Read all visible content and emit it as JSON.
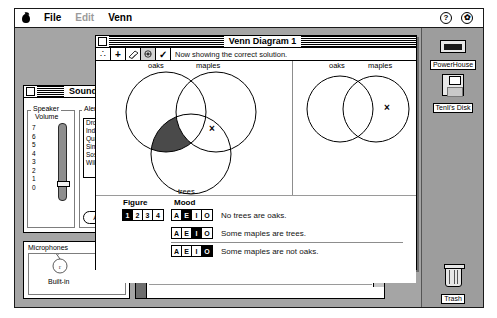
{
  "menubar": {
    "apple_icon": "apple-logo",
    "items": [
      {
        "label": "File",
        "enabled": true
      },
      {
        "label": "Edit",
        "enabled": false
      },
      {
        "label": "Venn",
        "enabled": true
      }
    ],
    "right_icons": [
      {
        "name": "help-icon",
        "glyph": "?"
      },
      {
        "name": "application-menu-icon",
        "glyph": "✿"
      }
    ]
  },
  "desktop": {
    "icons": [
      {
        "name": "hard-disk-icon",
        "label": "PowerHouse"
      },
      {
        "name": "floppy-disk-icon",
        "label": "Tenli's Disk"
      }
    ],
    "trash": {
      "label": "Trash"
    }
  },
  "sound_panel": {
    "title": "Sound",
    "speaker_group": {
      "label_line1": "Speaker",
      "label_line2": "Volume",
      "ticks": [
        "7",
        "6",
        "5",
        "4",
        "3",
        "2",
        "1",
        "0"
      ],
      "value": "2"
    },
    "alert_group": {
      "label": "Alert Sounds",
      "sounds": [
        "Droplet",
        "Indigo",
        "Quack",
        "Simple Beep",
        "Sosumi",
        "Wild Eep"
      ],
      "add_button": "Add"
    }
  },
  "mic_panel": {
    "title": "Microphones",
    "device_label": "Built-in"
  },
  "text_window": {
    "lines": [
      "Did gyre and gimble in the wabe.",
      "All mimsy were the borogoves,",
      "And the mome raths outgrabe."
    ]
  },
  "venn_window": {
    "title": "Venn Diagram 1",
    "toolbar": {
      "buttons": [
        {
          "name": "therefore-icon",
          "glyph": "∴"
        },
        {
          "name": "plus-icon",
          "glyph": "+"
        },
        {
          "name": "eraser-icon",
          "glyph": "╱"
        },
        {
          "name": "magnifier-icon",
          "glyph": "◔"
        },
        {
          "name": "check-icon",
          "glyph": "✓"
        }
      ],
      "status": "Now showing the correct solution."
    },
    "premise_diagram": {
      "circles": [
        "oaks",
        "maples",
        "trees"
      ],
      "x_mark": "×",
      "shaded": true
    },
    "conclusion_diagram": {
      "circles": [
        "oaks",
        "maples"
      ],
      "x_mark": "×"
    },
    "controls": {
      "figure_label": "Figure",
      "figure_options": [
        "1",
        "2",
        "3",
        "4"
      ],
      "figure_selected": "1",
      "mood_label": "Mood",
      "mood_options": [
        "A",
        "E",
        "I",
        "O"
      ],
      "rows": [
        {
          "selected": "E",
          "text": "No trees are oaks."
        },
        {
          "selected": "I",
          "text": "Some maples are trees."
        },
        {
          "selected": "O",
          "text": "Some maples are not oaks."
        }
      ]
    }
  }
}
